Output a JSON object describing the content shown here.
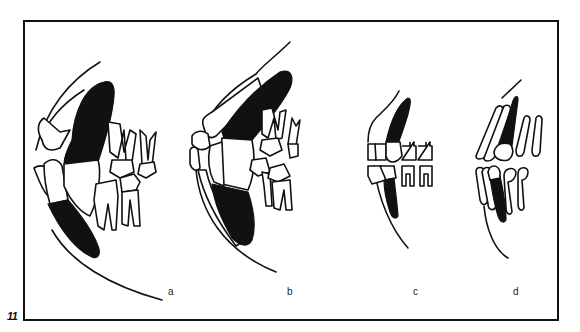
{
  "figure": {
    "number": "11",
    "colors": {
      "ink": "#111111",
      "background": "#ffffff"
    },
    "panels": [
      {
        "id": "a",
        "label": "a",
        "description": "Jaw profile with large canine teeth (shaded black) and molars"
      },
      {
        "id": "b",
        "label": "b",
        "description": "Jaw profile with large canine teeth (shaded black), incisors and premolars"
      },
      {
        "id": "c",
        "label": "c",
        "description": "Smaller jaw with slender canines (shaded black) and small rounded teeth"
      },
      {
        "id": "d",
        "label": "d",
        "description": "Small jaw with slender canines (shaded black) and elongated teeth"
      }
    ]
  }
}
